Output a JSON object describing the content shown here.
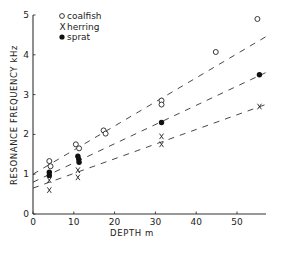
{
  "chart_data": {
    "type": "scatter",
    "title": "",
    "xlabel": "DEPTH m",
    "ylabel": "RESONANCE FREQUENCY kHz",
    "xlim": [
      0,
      57
    ],
    "ylim": [
      0,
      5
    ],
    "x_ticks": [
      0,
      10,
      20,
      30,
      40,
      50
    ],
    "y_ticks": [
      0,
      1,
      2,
      3,
      4,
      5
    ],
    "grid": false,
    "legend_position": "upper left",
    "series": [
      {
        "name": "coalfish",
        "marker": "open-circle",
        "points": [
          [
            4,
            1.33
          ],
          [
            4.3,
            1.2
          ],
          [
            10.5,
            1.75
          ],
          [
            11.3,
            1.65
          ],
          [
            17.3,
            2.1
          ],
          [
            17.8,
            2.02
          ],
          [
            31.5,
            2.85
          ],
          [
            31.5,
            2.75
          ],
          [
            44.8,
            4.07
          ],
          [
            55,
            4.9
          ]
        ],
        "fit_line": {
          "style": "dashed",
          "from": [
            0,
            1.0
          ],
          "to": [
            57,
            4.45
          ]
        }
      },
      {
        "name": "herring",
        "marker": "x",
        "points": [
          [
            4,
            0.85
          ],
          [
            4,
            0.6
          ],
          [
            11,
            1.1
          ],
          [
            11,
            0.92
          ],
          [
            31.5,
            1.95
          ],
          [
            31.5,
            1.75
          ],
          [
            55.5,
            2.7
          ]
        ],
        "fit_line": {
          "style": "dashed",
          "from": [
            0,
            0.65
          ],
          "to": [
            57,
            2.75
          ]
        }
      },
      {
        "name": "sprat",
        "marker": "filled-circle",
        "points": [
          [
            4,
            1.05
          ],
          [
            4,
            0.97
          ],
          [
            11,
            1.45
          ],
          [
            11.2,
            1.38
          ],
          [
            11.3,
            1.3
          ],
          [
            31.5,
            2.3
          ],
          [
            55.5,
            3.5
          ]
        ],
        "fit_line": {
          "style": "dashed",
          "from": [
            0,
            0.8
          ],
          "to": [
            57,
            3.55
          ]
        }
      }
    ]
  },
  "legend": {
    "items": [
      {
        "label": "coalfish",
        "marker": "open-circle"
      },
      {
        "label": "herring",
        "marker": "x"
      },
      {
        "label": "sprat",
        "marker": "filled-circle"
      }
    ]
  },
  "axes": {
    "xlabel": "DEPTH m",
    "ylabel": "RESONANCE FREQUENCY kHz"
  }
}
